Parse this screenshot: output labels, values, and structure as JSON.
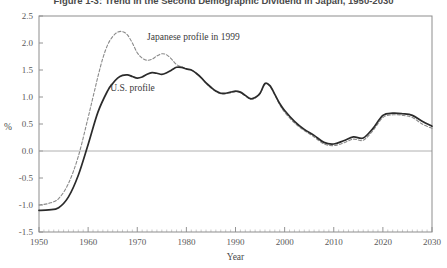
{
  "chart_data": {
    "type": "line",
    "title": "Figure 1-3: Trend in the Second Demographic Dividend in Japan, 1950-2030",
    "xlabel": "Year",
    "ylabel": "%",
    "xlim": [
      1950,
      2030
    ],
    "ylim": [
      -1.5,
      2.5
    ],
    "ytick_labels": [
      "2.5",
      "2.0",
      "1.5",
      "1.0",
      "0.5",
      "0.0",
      "-0.5",
      "-1.0",
      "-1.5"
    ],
    "ytick_values": [
      2.5,
      2.0,
      1.5,
      1.0,
      0.5,
      0.0,
      -0.5,
      -1.0,
      -1.5
    ],
    "xtick_labels": [
      "1950",
      "1960",
      "1970",
      "1980",
      "1990",
      "2000",
      "2010",
      "2020",
      "2030"
    ],
    "xtick_values": [
      1950,
      1960,
      1970,
      1980,
      1990,
      2000,
      2010,
      2020,
      2030
    ],
    "grid": false,
    "legend_position": "inline-annotations",
    "annotations": [
      {
        "text": "Japanese profile  in 1999",
        "x": 1972,
        "y": 2.05
      },
      {
        "text": "U.S. profile",
        "x": 1964.5,
        "y": 1.12
      }
    ],
    "series": [
      {
        "name": "Japanese profile  in 1999",
        "style": "dashed",
        "color": "#8a8a8a",
        "x": [
          1950,
          1952,
          1954,
          1956,
          1958,
          1960,
          1961,
          1962,
          1963,
          1964,
          1965,
          1966,
          1967,
          1968,
          1969,
          1970,
          1971,
          1972,
          1973,
          1974,
          1975,
          1976,
          1977,
          1978,
          1979,
          1980,
          1981,
          1982,
          1983,
          1984,
          1985,
          1986,
          1987,
          1988,
          1989,
          1990,
          1991,
          1992,
          1993,
          1994,
          1995,
          1996,
          1997,
          1998,
          1999,
          2000,
          2002,
          2004,
          2006,
          2008,
          2010,
          2012,
          2014,
          2016,
          2018,
          2020,
          2022,
          2024,
          2026,
          2028,
          2030
        ],
        "y": [
          -1.0,
          -0.97,
          -0.88,
          -0.6,
          -0.1,
          0.62,
          1.0,
          1.38,
          1.72,
          1.97,
          2.12,
          2.2,
          2.21,
          2.15,
          2.0,
          1.82,
          1.72,
          1.68,
          1.7,
          1.76,
          1.8,
          1.78,
          1.7,
          1.6,
          1.56,
          1.52,
          1.5,
          1.44,
          1.36,
          1.26,
          1.17,
          1.1,
          1.06,
          1.06,
          1.08,
          1.1,
          1.08,
          1.02,
          0.96,
          0.98,
          1.06,
          1.24,
          1.2,
          1.04,
          0.86,
          0.72,
          0.52,
          0.38,
          0.26,
          0.13,
          0.1,
          0.15,
          0.22,
          0.2,
          0.38,
          0.62,
          0.67,
          0.66,
          0.62,
          0.5,
          0.42
        ]
      },
      {
        "name": "U.S. profile",
        "style": "solid",
        "color": "#2b2b2b",
        "x": [
          1950,
          1952,
          1954,
          1956,
          1958,
          1960,
          1962,
          1964,
          1965,
          1966,
          1967,
          1968,
          1969,
          1970,
          1971,
          1972,
          1973,
          1974,
          1975,
          1976,
          1977,
          1978,
          1979,
          1980,
          1981,
          1982,
          1983,
          1984,
          1985,
          1986,
          1987,
          1988,
          1989,
          1990,
          1991,
          1992,
          1993,
          1994,
          1995,
          1996,
          1997,
          1998,
          1999,
          2000,
          2002,
          2004,
          2006,
          2008,
          2010,
          2012,
          2014,
          2016,
          2018,
          2020,
          2022,
          2024,
          2026,
          2028,
          2030
        ],
        "y": [
          -1.1,
          -1.09,
          -1.05,
          -0.85,
          -0.45,
          0.12,
          0.72,
          1.12,
          1.25,
          1.35,
          1.4,
          1.41,
          1.38,
          1.35,
          1.37,
          1.42,
          1.45,
          1.44,
          1.42,
          1.45,
          1.5,
          1.55,
          1.55,
          1.52,
          1.5,
          1.44,
          1.36,
          1.26,
          1.18,
          1.11,
          1.07,
          1.07,
          1.09,
          1.11,
          1.09,
          1.03,
          0.97,
          0.99,
          1.07,
          1.25,
          1.21,
          1.05,
          0.88,
          0.75,
          0.55,
          0.4,
          0.29,
          0.16,
          0.13,
          0.19,
          0.26,
          0.24,
          0.42,
          0.66,
          0.7,
          0.69,
          0.66,
          0.55,
          0.46
        ]
      }
    ]
  }
}
